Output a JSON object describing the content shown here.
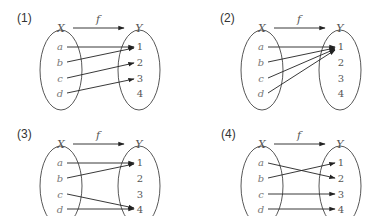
{
  "figure": {
    "panels": [
      {
        "label": "(1)",
        "domain_label": "X",
        "codomain_label": "Y",
        "function_label": "f",
        "domain": [
          "a",
          "b",
          "c",
          "d"
        ],
        "codomain": [
          "1",
          "2",
          "3",
          "4"
        ],
        "mapping": [
          [
            "a",
            "1"
          ],
          [
            "b",
            "1"
          ],
          [
            "c",
            "2"
          ],
          [
            "d",
            "3"
          ]
        ]
      },
      {
        "label": "(2)",
        "domain_label": "X",
        "codomain_label": "Y",
        "function_label": "f",
        "domain": [
          "a",
          "b",
          "c",
          "d"
        ],
        "codomain": [
          "1",
          "2",
          "3",
          "4"
        ],
        "mapping": [
          [
            "a",
            "1"
          ],
          [
            "b",
            "1"
          ],
          [
            "c",
            "1"
          ],
          [
            "d",
            "1"
          ]
        ]
      },
      {
        "label": "(3)",
        "domain_label": "X",
        "codomain_label": "Y",
        "function_label": "f",
        "domain": [
          "a",
          "b",
          "c",
          "d"
        ],
        "codomain": [
          "1",
          "2",
          "3",
          "4"
        ],
        "mapping": [
          [
            "a",
            "1"
          ],
          [
            "b",
            "1"
          ],
          [
            "c",
            "4"
          ],
          [
            "d",
            "4"
          ]
        ]
      },
      {
        "label": "(4)",
        "domain_label": "X",
        "codomain_label": "Y",
        "function_label": "f",
        "domain": [
          "a",
          "b",
          "c",
          "d"
        ],
        "codomain": [
          "1",
          "2",
          "3",
          "4"
        ],
        "mapping": [
          [
            "a",
            "2"
          ],
          [
            "b",
            "1"
          ],
          [
            "c",
            "3"
          ],
          [
            "d",
            "4"
          ]
        ]
      }
    ]
  }
}
